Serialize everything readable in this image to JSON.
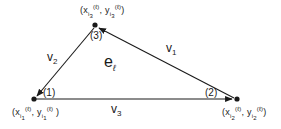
{
  "diagram": {
    "type": "triangle-element",
    "element_label": {
      "base": "e",
      "sub": "ℓ"
    },
    "colors": {
      "stroke": "#1a1a1a",
      "background": "#ffffff"
    },
    "vertices": [
      {
        "id": "1",
        "local_label": "(1)",
        "x": 34,
        "y": 99,
        "coord_text": {
          "open": "(",
          "x": "x",
          "x_sub": "i",
          "x_subsub": "1",
          "x_sup": "(ℓ)",
          "sep": ",",
          "y": "y",
          "y_sub": "i",
          "y_subsub": "1",
          "y_sup": "(ℓ)",
          "close": ")"
        }
      },
      {
        "id": "2",
        "local_label": "(2)",
        "x": 236,
        "y": 99,
        "coord_text": {
          "open": "(",
          "x": "x",
          "x_sub": "i",
          "x_subsub": "2",
          "x_sup": "(ℓ)",
          "sep": ",",
          "y": "y",
          "y_sub": "i",
          "y_subsub": "2",
          "y_sup": "(ℓ)",
          "close": ")"
        }
      },
      {
        "id": "3",
        "local_label": "(3)",
        "x": 95,
        "y": 26,
        "coord_text": {
          "open": "(",
          "x": "x",
          "x_sub": "i",
          "x_subsub": "3",
          "x_sup": "(ℓ)",
          "sep": ",",
          "y": "y",
          "y_sub": "i",
          "y_subsub": "3",
          "y_sup": "(ℓ)",
          "close": ")"
        }
      }
    ],
    "edges": [
      {
        "id": "v1",
        "label": {
          "base": "v",
          "sub": "1"
        },
        "from": "2",
        "to": "3"
      },
      {
        "id": "v2",
        "label": {
          "base": "v",
          "sub": "2"
        },
        "from": "3",
        "to": "1"
      },
      {
        "id": "v3",
        "label": {
          "base": "v",
          "sub": "3"
        },
        "from": "1",
        "to": "2"
      }
    ]
  }
}
